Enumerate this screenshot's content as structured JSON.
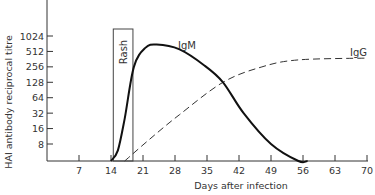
{
  "chart_data": {
    "type": "line",
    "title": "",
    "xlabel": "Days after infection",
    "ylabel": "HAI antibody reciprocal titre",
    "x_ticks": [
      7,
      14,
      21,
      28,
      35,
      42,
      49,
      56,
      63,
      70
    ],
    "x_tick_labels": [
      "7",
      "14",
      "21",
      "28",
      "35",
      "42",
      "49",
      "56",
      "63",
      "70"
    ],
    "y_ticks": [
      8,
      16,
      32,
      64,
      128,
      256,
      512,
      1024
    ],
    "y_tick_labels": [
      "8",
      "16",
      "32",
      "64",
      "128",
      "256",
      "512",
      "1024"
    ],
    "y_scale": "log2",
    "xlim": [
      0,
      70
    ],
    "ylim": [
      2.3,
      2200
    ],
    "grid": false,
    "legend": "inline labels",
    "annotations": [
      {
        "text": "Rash",
        "type": "shaded-interval-box",
        "x_start": 14.5,
        "x_end": 18.8
      }
    ],
    "series": [
      {
        "name": "IgM",
        "style": "solid",
        "color": "#111111",
        "x": [
          14,
          15.5,
          17,
          19,
          21.5,
          24,
          29,
          34.5,
          38.5,
          43,
          49,
          55,
          57
        ],
        "values": [
          2.5,
          6,
          25,
          256,
          600,
          700,
          560,
          270,
          128,
          32,
          8,
          2.5,
          2.3
        ]
      },
      {
        "name": "IgG",
        "style": "dashed",
        "color": "#333333",
        "x": [
          17,
          22.5,
          29,
          38.5,
          47,
          55,
          70
        ],
        "values": [
          2.5,
          10,
          30,
          128,
          256,
          350,
          380
        ]
      }
    ]
  },
  "labels": {
    "xlabel": "Days after infection",
    "ylabel": "HAI antibody reciprocal titre",
    "rash": "Rash",
    "igm": "IgM",
    "igg": "IgG"
  }
}
